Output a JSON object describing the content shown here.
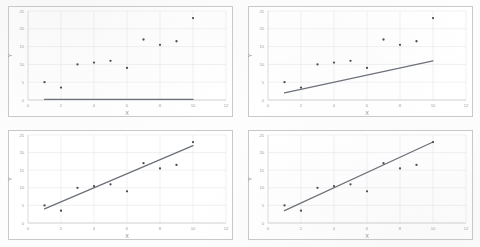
{
  "page": {
    "background_color": "#fdfdfd",
    "panel_border_color": "#c9c9cc"
  },
  "axes": {
    "xlabel": "X",
    "ylabel": "Y",
    "xlim": [
      0,
      12
    ],
    "ylim": [
      0,
      25
    ],
    "xticks": [
      0,
      2,
      4,
      6,
      8,
      10,
      12
    ],
    "yticks": [
      0,
      5,
      10,
      15,
      20,
      25
    ],
    "xtick_labels": [
      "0",
      "2",
      "4",
      "6",
      "8",
      "10",
      "12"
    ],
    "ytick_labels": [
      "0",
      "5",
      "10",
      "15",
      "20",
      "25"
    ],
    "grid": true,
    "grid_color": "#dcdce1"
  },
  "marker": {
    "color": "#4a4a50",
    "shape": "circle",
    "radius": 1.15
  },
  "line": {
    "color": "#6a6f78",
    "width": 1.25
  },
  "chart_data": [
    {
      "id": "top-left",
      "type": "scatter",
      "title": "",
      "xlabel": "X",
      "ylabel": "Y",
      "xlim": [
        0,
        12
      ],
      "ylim": [
        0,
        25
      ],
      "grid": true,
      "legend": "none",
      "x": [
        1,
        2,
        3,
        4,
        5,
        6,
        7,
        8,
        9,
        10
      ],
      "y": [
        5,
        3.5,
        10,
        10.5,
        11,
        9,
        17,
        15.5,
        16.5,
        23
      ],
      "fit_line": {
        "label": "flat-line",
        "x0": 1,
        "y0": 0.15,
        "x1": 10,
        "y1": 0.15,
        "slope": 0,
        "intercept": 0.15
      }
    },
    {
      "id": "top-right",
      "type": "scatter",
      "title": "",
      "xlabel": "X",
      "ylabel": "Y",
      "xlim": [
        0,
        12
      ],
      "ylim": [
        0,
        25
      ],
      "grid": true,
      "legend": "none",
      "x": [
        1,
        2,
        3,
        4,
        5,
        6,
        7,
        8,
        9,
        10
      ],
      "y": [
        5,
        3.5,
        10,
        10.5,
        11,
        9,
        17,
        15.5,
        16.5,
        23
      ],
      "fit_line": {
        "label": "shallow-line",
        "x0": 1,
        "y0": 2.0,
        "x1": 10,
        "y1": 11.0,
        "slope": 1.0,
        "intercept": 1.0
      }
    },
    {
      "id": "bottom-left",
      "type": "scatter",
      "title": "",
      "xlabel": "X",
      "ylabel": "Y",
      "xlim": [
        0,
        12
      ],
      "ylim": [
        0,
        25
      ],
      "grid": true,
      "legend": "none",
      "x": [
        1,
        2,
        3,
        4,
        5,
        6,
        7,
        8,
        9,
        10
      ],
      "y": [
        5,
        3.5,
        10,
        10.5,
        11,
        9,
        17,
        15.5,
        16.5,
        23
      ],
      "fit_line": {
        "label": "best-fit-line",
        "x0": 1,
        "y0": 4.0,
        "x1": 10,
        "y1": 22.0,
        "slope": 2.0,
        "intercept": 2.0
      }
    },
    {
      "id": "bottom-right",
      "type": "scatter",
      "title": "",
      "xlabel": "X",
      "ylabel": "Y",
      "xlim": [
        0,
        12
      ],
      "ylim": [
        0,
        25
      ],
      "grid": true,
      "legend": "none",
      "x": [
        1,
        2,
        3,
        4,
        5,
        6,
        7,
        8,
        9,
        10
      ],
      "y": [
        5,
        3.5,
        10,
        10.5,
        11,
        9,
        17,
        15.5,
        16.5,
        23
      ],
      "fit_line": {
        "label": "steeper-fit-line",
        "x0": 1,
        "y0": 3.5,
        "x1": 10,
        "y1": 23.0,
        "slope": 2.1667,
        "intercept": 1.3333
      }
    }
  ]
}
